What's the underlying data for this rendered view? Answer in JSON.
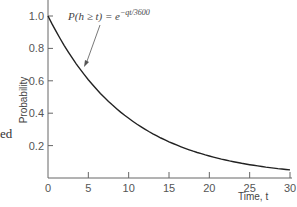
{
  "chart_data": {
    "type": "line",
    "title": "",
    "xlabel": "Time, t",
    "ylabel": "Probability",
    "xlim": [
      0,
      30
    ],
    "ylim": [
      0,
      1.0
    ],
    "x_ticks": [
      "0",
      "5",
      "10",
      "15",
      "20",
      "25",
      "30"
    ],
    "y_ticks": [
      "0.2",
      "0.4",
      "0.6",
      "0.8",
      "1.0"
    ],
    "grid": false,
    "annotation": {
      "text_main": "P(h ≥ t) = e",
      "text_exponent": "−qt/3600",
      "points_to_x": 4.5
    },
    "series": [
      {
        "name": "P(h ≥ t)",
        "x": [
          0,
          2.5,
          5,
          7.5,
          10,
          12.5,
          15,
          17.5,
          20,
          22.5,
          25,
          27.5,
          30
        ],
        "values": [
          1.0,
          0.78,
          0.61,
          0.47,
          0.37,
          0.29,
          0.22,
          0.17,
          0.14,
          0.11,
          0.08,
          0.065,
          0.05
        ]
      }
    ]
  },
  "stray_text": "ed"
}
